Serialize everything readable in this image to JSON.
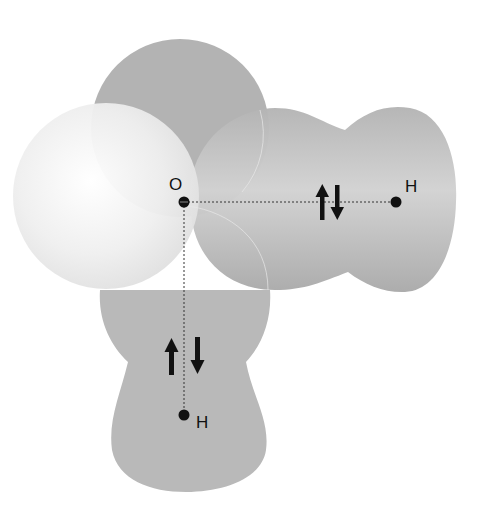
{
  "diagram": {
    "atoms": {
      "oxygen": {
        "label": "O",
        "x": 184,
        "y": 202
      },
      "hydrogen_right": {
        "label": "H",
        "x": 396,
        "y": 202
      },
      "hydrogen_bottom": {
        "label": "H",
        "x": 184,
        "y": 415
      }
    },
    "bonds": [
      {
        "from": "oxygen",
        "to": "hydrogen_right",
        "style": "dotted",
        "electron_pair": "up-down"
      },
      {
        "from": "oxygen",
        "to": "hydrogen_bottom",
        "style": "dotted",
        "electron_pair": "up-down"
      }
    ],
    "lobes": [
      {
        "name": "lone-pair-top",
        "color": "#b5b5b5"
      },
      {
        "name": "lone-pair-left",
        "color": "#eeeeee"
      },
      {
        "name": "bonding-right",
        "color": "#b0b0b0"
      },
      {
        "name": "bonding-bottom",
        "color": "#b8b8b8"
      }
    ],
    "colors": {
      "background": "#ffffff",
      "lobe_dark": "#b4b4b4",
      "lobe_light": "#f0f0f0",
      "nucleus": "#111111",
      "text": "#111111"
    }
  }
}
